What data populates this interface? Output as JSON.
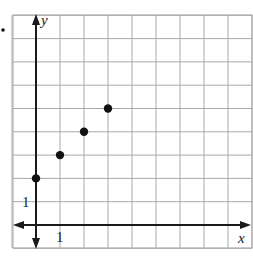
{
  "chart_data": {
    "type": "scatter",
    "title": "",
    "xlabel": "x",
    "ylabel": "y",
    "x_tick_label": "1",
    "y_tick_label": "1",
    "xlim": [
      -1,
      9
    ],
    "ylim": [
      -1,
      9
    ],
    "grid": true,
    "grid_step": 1,
    "points": [
      {
        "x": 0,
        "y": 2
      },
      {
        "x": 1,
        "y": 3
      },
      {
        "x": 2,
        "y": 4
      },
      {
        "x": 3,
        "y": 5
      }
    ],
    "colors": {
      "grid": "#a8a8a8",
      "axis": "#1a1a1a",
      "points": "#111111"
    }
  },
  "labels": {
    "x_axis": "x",
    "y_axis": "y",
    "x_tick": "1",
    "y_tick": "1"
  }
}
